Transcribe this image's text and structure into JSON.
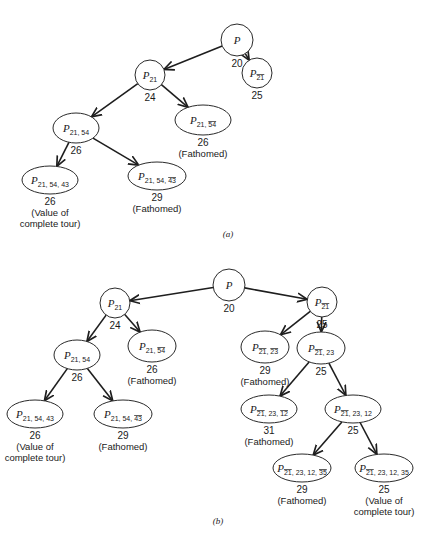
{
  "diagrams": [
    {
      "caption": "(a)",
      "nodes": [
        {
          "id": "a0",
          "base": "P",
          "parts": [],
          "bound": "20",
          "notes": []
        },
        {
          "id": "a1",
          "base": "P",
          "parts": [
            {
              "t": "21",
              "bar": false
            }
          ],
          "bound": "24",
          "notes": []
        },
        {
          "id": "a2",
          "base": "P",
          "parts": [
            {
              "t": "21",
              "bar": true
            }
          ],
          "bound": "25",
          "notes": []
        },
        {
          "id": "a3",
          "base": "P",
          "parts": [
            {
              "t": "21",
              "bar": false
            },
            {
              "t": "54",
              "bar": false
            }
          ],
          "bound": "26",
          "notes": []
        },
        {
          "id": "a4",
          "base": "P",
          "parts": [
            {
              "t": "21",
              "bar": false
            },
            {
              "t": "54",
              "bar": true
            }
          ],
          "bound": "26",
          "notes": [
            "(Fathomed)"
          ]
        },
        {
          "id": "a5",
          "base": "P",
          "parts": [
            {
              "t": "21",
              "bar": false
            },
            {
              "t": "54",
              "bar": false
            },
            {
              "t": "43",
              "bar": false
            }
          ],
          "bound": "26",
          "notes": [
            "(Value of",
            "complete tour)"
          ]
        },
        {
          "id": "a6",
          "base": "P",
          "parts": [
            {
              "t": "21",
              "bar": false
            },
            {
              "t": "54",
              "bar": false
            },
            {
              "t": "43",
              "bar": true
            }
          ],
          "bound": "29",
          "notes": [
            "(Fathomed)"
          ]
        }
      ],
      "edges": [
        [
          "a0",
          "a1"
        ],
        [
          "a0",
          "a2"
        ],
        [
          "a1",
          "a3"
        ],
        [
          "a1",
          "a4"
        ],
        [
          "a3",
          "a5"
        ],
        [
          "a3",
          "a6"
        ]
      ]
    },
    {
      "caption": "(b)",
      "nodes": [
        {
          "id": "b0",
          "base": "P",
          "parts": [],
          "bound": "20",
          "notes": []
        },
        {
          "id": "b1",
          "base": "P",
          "parts": [
            {
              "t": "21",
              "bar": false
            }
          ],
          "bound": "24",
          "notes": []
        },
        {
          "id": "b2",
          "base": "P",
          "parts": [
            {
              "t": "21",
              "bar": true
            }
          ],
          "bound": "25",
          "notes": []
        },
        {
          "id": "b3",
          "base": "P",
          "parts": [
            {
              "t": "21",
              "bar": false
            },
            {
              "t": "54",
              "bar": false
            }
          ],
          "bound": "26",
          "notes": []
        },
        {
          "id": "b4",
          "base": "P",
          "parts": [
            {
              "t": "21",
              "bar": false
            },
            {
              "t": "54",
              "bar": true
            }
          ],
          "bound": "26",
          "notes": [
            "(Fathomed)"
          ]
        },
        {
          "id": "b5",
          "base": "P",
          "parts": [
            {
              "t": "21",
              "bar": true
            },
            {
              "t": "23",
              "bar": true
            }
          ],
          "bound": "29",
          "notes": [
            "(Fathomed)"
          ]
        },
        {
          "id": "b6",
          "base": "P",
          "parts": [
            {
              "t": "21",
              "bar": true
            },
            {
              "t": "23",
              "bar": false
            }
          ],
          "bound": "25",
          "notes": []
        },
        {
          "id": "b7",
          "base": "P",
          "parts": [
            {
              "t": "21",
              "bar": false
            },
            {
              "t": "54",
              "bar": false
            },
            {
              "t": "43",
              "bar": false
            }
          ],
          "bound": "26",
          "notes": [
            "(Value of",
            "complete tour)"
          ]
        },
        {
          "id": "b8",
          "base": "P",
          "parts": [
            {
              "t": "21",
              "bar": false
            },
            {
              "t": "54",
              "bar": false
            },
            {
              "t": "43",
              "bar": true
            }
          ],
          "bound": "29",
          "notes": [
            "(Fathomed)"
          ]
        },
        {
          "id": "b9",
          "base": "P",
          "parts": [
            {
              "t": "21",
              "bar": true
            },
            {
              "t": "23",
              "bar": false
            },
            {
              "t": "12",
              "bar": true
            }
          ],
          "bound": "31",
          "notes": [
            "(Fathomed)"
          ]
        },
        {
          "id": "b10",
          "base": "P",
          "parts": [
            {
              "t": "21",
              "bar": true
            },
            {
              "t": "23",
              "bar": false
            },
            {
              "t": "12",
              "bar": false
            }
          ],
          "bound": "25",
          "notes": []
        },
        {
          "id": "b11",
          "base": "P",
          "parts": [
            {
              "t": "21",
              "bar": true
            },
            {
              "t": "23",
              "bar": false
            },
            {
              "t": "12",
              "bar": false
            },
            {
              "t": "35",
              "bar": true
            }
          ],
          "bound": "29",
          "notes": [
            "(Fathomed)"
          ]
        },
        {
          "id": "b12",
          "base": "P",
          "parts": [
            {
              "t": "21",
              "bar": true
            },
            {
              "t": "23",
              "bar": false
            },
            {
              "t": "12",
              "bar": false
            },
            {
              "t": "35",
              "bar": false
            }
          ],
          "bound": "25",
          "notes": [
            "(Value of",
            "complete tour)"
          ]
        }
      ],
      "edges": [
        [
          "b0",
          "b1"
        ],
        [
          "b0",
          "b2"
        ],
        [
          "b1",
          "b3"
        ],
        [
          "b1",
          "b4"
        ],
        [
          "b2",
          "b5"
        ],
        [
          "b2",
          "b6"
        ],
        [
          "b3",
          "b7"
        ],
        [
          "b3",
          "b8"
        ],
        [
          "b6",
          "b9"
        ],
        [
          "b6",
          "b10"
        ],
        [
          "b10",
          "b11"
        ],
        [
          "b10",
          "b12"
        ]
      ]
    }
  ]
}
